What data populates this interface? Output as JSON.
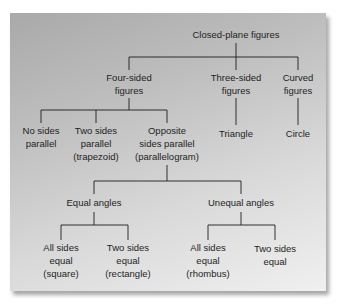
{
  "diagram": {
    "type": "classification-tree",
    "root": "Closed-plane figures",
    "nodes": {
      "root": {
        "label": "Closed-plane figures"
      },
      "four_sided": {
        "label_line1": "Four-sided",
        "label_line2": "figures"
      },
      "three_sided": {
        "label_line1": "Three-sided",
        "label_line2": "figures"
      },
      "curved": {
        "label_line1": "Curved",
        "label_line2": "figures"
      },
      "no_sides_parallel": {
        "label_line1": "No sides",
        "label_line2": "parallel"
      },
      "trapezoid": {
        "label_line1": "Two sides",
        "label_line2": "parallel",
        "label_line3": "(trapezoid)"
      },
      "parallelogram": {
        "label_line1": "Opposite",
        "label_line2": "sides parallel",
        "label_line3": "(parallelogram)"
      },
      "triangle": {
        "label": "Triangle"
      },
      "circle": {
        "label": "Circle"
      },
      "equal_angles": {
        "label": "Equal angles"
      },
      "unequal_angles": {
        "label": "Unequal angles"
      },
      "square": {
        "label_line1": "All sides",
        "label_line2": "equal",
        "label_line3": "(square)"
      },
      "rectangle": {
        "label_line1": "Two sides",
        "label_line2": "equal",
        "label_line3": "(rectangle)"
      },
      "rhombus": {
        "label_line1": "All sides",
        "label_line2": "equal",
        "label_line3": "(rhombus)"
      },
      "two_sides_equal": {
        "label_line1": "Two sides",
        "label_line2": "equal"
      }
    },
    "edges": [
      [
        "root",
        "four_sided"
      ],
      [
        "root",
        "three_sided"
      ],
      [
        "root",
        "curved"
      ],
      [
        "four_sided",
        "no_sides_parallel"
      ],
      [
        "four_sided",
        "trapezoid"
      ],
      [
        "four_sided",
        "parallelogram"
      ],
      [
        "three_sided",
        "triangle"
      ],
      [
        "curved",
        "circle"
      ],
      [
        "parallelogram",
        "equal_angles"
      ],
      [
        "parallelogram",
        "unequal_angles"
      ],
      [
        "equal_angles",
        "square"
      ],
      [
        "equal_angles",
        "rectangle"
      ],
      [
        "unequal_angles",
        "rhombus"
      ],
      [
        "unequal_angles",
        "two_sides_equal"
      ]
    ],
    "colors": {
      "panel_dark": "#a9a9a9",
      "panel_light": "#f0f0f0",
      "line": "#1e1e1e",
      "text": "#1e1e1e"
    }
  }
}
